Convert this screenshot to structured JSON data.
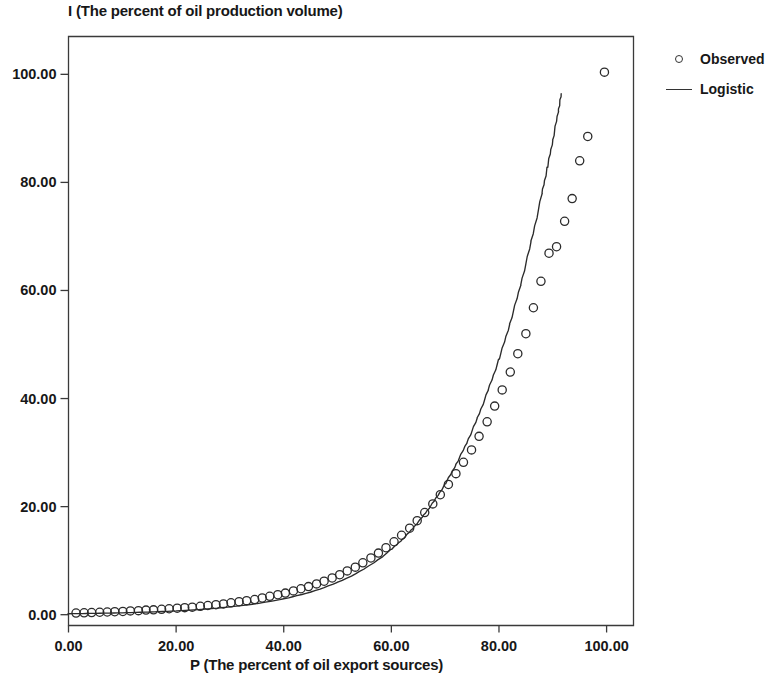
{
  "chart_data": {
    "type": "scatter",
    "title": "",
    "xlabel": "P (The percent of oil export sources)",
    "ylabel": "I (The percent of oil production volume)",
    "xlim": [
      0,
      105
    ],
    "ylim": [
      -2,
      107
    ],
    "xticks": [
      "0.00",
      "20.00",
      "40.00",
      "60.00",
      "80.00",
      "100.00"
    ],
    "xtick_values": [
      0,
      20,
      40,
      60,
      80,
      100
    ],
    "yticks": [
      "0.00",
      "20.00",
      "40.00",
      "60.00",
      "80.00",
      "100.00"
    ],
    "ytick_values": [
      0,
      20,
      40,
      60,
      80,
      100
    ],
    "grid": false,
    "legend_position": "right",
    "series": [
      {
        "name": "Observed",
        "marker": "open-circle",
        "type": "scatter",
        "x": [
          1.4,
          2.9,
          4.3,
          5.8,
          7.2,
          8.6,
          10.1,
          11.5,
          13.0,
          14.4,
          15.8,
          17.3,
          18.7,
          20.2,
          21.6,
          23.0,
          24.5,
          25.9,
          27.4,
          28.8,
          30.2,
          31.7,
          33.1,
          34.6,
          36.0,
          37.4,
          38.9,
          40.3,
          41.8,
          43.2,
          44.6,
          46.1,
          47.5,
          49.0,
          50.4,
          51.8,
          53.3,
          54.7,
          56.2,
          57.6,
          59.0,
          60.5,
          61.9,
          63.4,
          64.8,
          66.2,
          67.7,
          69.1,
          70.6,
          72.0,
          73.4,
          74.9,
          76.3,
          77.8,
          79.2,
          80.6,
          82.1,
          83.5,
          85.0,
          86.4,
          87.8,
          89.3,
          90.7,
          92.2,
          93.6,
          95.0,
          96.5,
          99.6
        ],
        "y": [
          0.3,
          0.35,
          0.4,
          0.45,
          0.5,
          0.55,
          0.6,
          0.7,
          0.75,
          0.85,
          0.9,
          1.0,
          1.1,
          1.2,
          1.3,
          1.4,
          1.55,
          1.7,
          1.85,
          2.0,
          2.2,
          2.4,
          2.6,
          2.8,
          3.1,
          3.4,
          3.7,
          4.0,
          4.4,
          4.8,
          5.2,
          5.7,
          6.2,
          6.8,
          7.4,
          8.1,
          8.8,
          9.6,
          10.5,
          11.4,
          12.4,
          13.5,
          14.7,
          16.0,
          17.4,
          18.9,
          20.5,
          22.2,
          24.1,
          26.1,
          28.2,
          30.5,
          33.0,
          35.7,
          38.6,
          41.6,
          44.9,
          48.3,
          52.0,
          56.8,
          61.7,
          66.9,
          68.1,
          72.8,
          77.0,
          84.0,
          88.5,
          100.4
        ]
      },
      {
        "name": "Logistic",
        "type": "line",
        "x": [
          0,
          5,
          10,
          15,
          20,
          25,
          30,
          35,
          40,
          45,
          50,
          55,
          60,
          62,
          64,
          66,
          68,
          70,
          72,
          74,
          76,
          78,
          80,
          82,
          84,
          86,
          88,
          89,
          90,
          91,
          91.6
        ],
        "y": [
          0.18,
          0.25,
          0.35,
          0.5,
          0.7,
          1.0,
          1.45,
          2.05,
          2.95,
          4.2,
          6.0,
          8.5,
          12.1,
          13.9,
          16.0,
          18.4,
          21.1,
          24.2,
          27.8,
          31.8,
          36.4,
          41.6,
          47.3,
          53.8,
          61.0,
          69.1,
          78.0,
          82.8,
          87.8,
          93.1,
          96.4
        ]
      }
    ]
  },
  "legend": {
    "entries": [
      {
        "label": "Observed",
        "key": "open-circle-marker"
      },
      {
        "label": "Logistic",
        "key": "line-segment"
      }
    ]
  }
}
